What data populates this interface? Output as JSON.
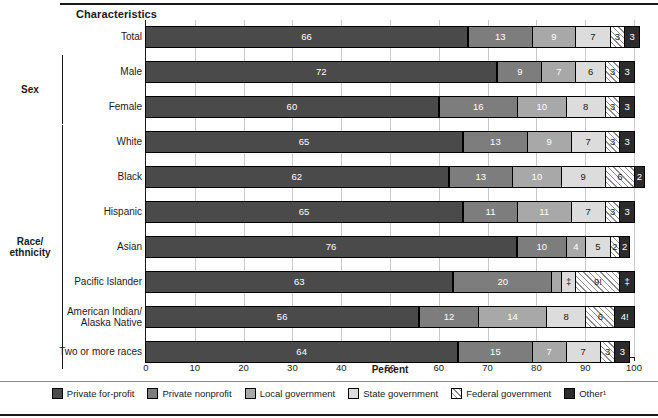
{
  "header": {
    "characteristics_label": "Characteristics"
  },
  "axis": {
    "xtitle": "Percent",
    "ticks": [
      "0",
      "10",
      "20",
      "30",
      "40",
      "50",
      "60",
      "70",
      "80",
      "90",
      "100"
    ]
  },
  "groups": [
    {
      "name": "",
      "label": ""
    },
    {
      "name": "sex",
      "label": "Sex"
    },
    {
      "name": "race-ethnicity",
      "label": "Race/\nethnicity"
    }
  ],
  "group_labels": {
    "sex": "Sex",
    "race_line1": "Race/",
    "race_line2": "ethnicity"
  },
  "legend": {
    "items": [
      {
        "key": "private-for-profit",
        "label": "Private for-profit",
        "color": "#4a4a4a"
      },
      {
        "key": "private-nonprofit",
        "label": "Private nonprofit",
        "color": "#7d7d7d"
      },
      {
        "key": "local-government",
        "label": "Local government",
        "color": "#a8a8a8"
      },
      {
        "key": "state-government",
        "label": "State government",
        "color": "#dcdcdc"
      },
      {
        "key": "federal-government",
        "label": "Federal government",
        "color": "#ffffff"
      },
      {
        "key": "other",
        "label": "Other¹",
        "color": "#2b2b2b"
      }
    ]
  },
  "chart_data": {
    "type": "bar",
    "orientation": "horizontal",
    "stacked": true,
    "title": "",
    "xlabel": "Percent",
    "ylabel": "Characteristics",
    "xlim": [
      0,
      100
    ],
    "grid": true,
    "legend_position": "bottom",
    "series": [
      {
        "name": "Private for-profit",
        "values": [
          66,
          72,
          60,
          65,
          62,
          65,
          76,
          63,
          56,
          64
        ]
      },
      {
        "name": "Private nonprofit",
        "values": [
          13,
          9,
          16,
          13,
          13,
          11,
          10,
          20,
          12,
          15
        ]
      },
      {
        "name": "Local government",
        "values": [
          9,
          7,
          10,
          9,
          10,
          11,
          4,
          2,
          14,
          7
        ]
      },
      {
        "name": "State government",
        "values": [
          7,
          6,
          8,
          7,
          9,
          7,
          5,
          3,
          8,
          7
        ]
      },
      {
        "name": "Federal government",
        "values": [
          3,
          3,
          3,
          3,
          6,
          3,
          2,
          9,
          6,
          3
        ]
      },
      {
        "name": "Other",
        "values": [
          3,
          3,
          3,
          3,
          2,
          3,
          2,
          3,
          4,
          3
        ]
      }
    ],
    "categories": [
      "Total",
      "Male",
      "Female",
      "White",
      "Black",
      "Hispanic",
      "Asian",
      "Pacific Islander",
      "American Indian/Alaska Native",
      "Two or more races"
    ],
    "rows": [
      {
        "label": "Total",
        "label_lines": [
          "Total"
        ],
        "group": "",
        "segments": [
          {
            "series": "Private for-profit",
            "value": 66,
            "text": "66"
          },
          {
            "series": "Private nonprofit",
            "value": 13,
            "text": "13"
          },
          {
            "series": "Local government",
            "value": 9,
            "text": "9"
          },
          {
            "series": "State government",
            "value": 7,
            "text": "7"
          },
          {
            "series": "Federal government",
            "value": 3,
            "text": "3"
          },
          {
            "series": "Other",
            "value": 3,
            "text": "3"
          }
        ]
      },
      {
        "label": "Male",
        "label_lines": [
          "Male"
        ],
        "group": "Sex",
        "segments": [
          {
            "series": "Private for-profit",
            "value": 72,
            "text": "72"
          },
          {
            "series": "Private nonprofit",
            "value": 9,
            "text": "9"
          },
          {
            "series": "Local government",
            "value": 7,
            "text": "7"
          },
          {
            "series": "State government",
            "value": 6,
            "text": "6"
          },
          {
            "series": "Federal government",
            "value": 3,
            "text": "3"
          },
          {
            "series": "Other",
            "value": 3,
            "text": "3"
          }
        ]
      },
      {
        "label": "Female",
        "label_lines": [
          "Female"
        ],
        "group": "Sex",
        "segments": [
          {
            "series": "Private for-profit",
            "value": 60,
            "text": "60"
          },
          {
            "series": "Private nonprofit",
            "value": 16,
            "text": "16"
          },
          {
            "series": "Local government",
            "value": 10,
            "text": "10"
          },
          {
            "series": "State government",
            "value": 8,
            "text": "8"
          },
          {
            "series": "Federal government",
            "value": 3,
            "text": "3"
          },
          {
            "series": "Other",
            "value": 3,
            "text": "3"
          }
        ]
      },
      {
        "label": "White",
        "label_lines": [
          "White"
        ],
        "group": "Race/ethnicity",
        "segments": [
          {
            "series": "Private for-profit",
            "value": 65,
            "text": "65"
          },
          {
            "series": "Private nonprofit",
            "value": 13,
            "text": "13"
          },
          {
            "series": "Local government",
            "value": 9,
            "text": "9"
          },
          {
            "series": "State government",
            "value": 7,
            "text": "7"
          },
          {
            "series": "Federal government",
            "value": 3,
            "text": "3"
          },
          {
            "series": "Other",
            "value": 3,
            "text": "3"
          }
        ]
      },
      {
        "label": "Black",
        "label_lines": [
          "Black"
        ],
        "group": "Race/ethnicity",
        "segments": [
          {
            "series": "Private for-profit",
            "value": 62,
            "text": "62"
          },
          {
            "series": "Private nonprofit",
            "value": 13,
            "text": "13"
          },
          {
            "series": "Local government",
            "value": 10,
            "text": "10"
          },
          {
            "series": "State government",
            "value": 9,
            "text": "9"
          },
          {
            "series": "Federal government",
            "value": 6,
            "text": "6"
          },
          {
            "series": "Other",
            "value": 2,
            "text": "2"
          }
        ]
      },
      {
        "label": "Hispanic",
        "label_lines": [
          "Hispanic"
        ],
        "group": "Race/ethnicity",
        "segments": [
          {
            "series": "Private for-profit",
            "value": 65,
            "text": "65"
          },
          {
            "series": "Private nonprofit",
            "value": 11,
            "text": "11"
          },
          {
            "series": "Local government",
            "value": 11,
            "text": "11"
          },
          {
            "series": "State government",
            "value": 7,
            "text": "7"
          },
          {
            "series": "Federal government",
            "value": 3,
            "text": "3"
          },
          {
            "series": "Other",
            "value": 3,
            "text": "3"
          }
        ]
      },
      {
        "label": "Asian",
        "label_lines": [
          "Asian"
        ],
        "group": "Race/ethnicity",
        "segments": [
          {
            "series": "Private for-profit",
            "value": 76,
            "text": "76"
          },
          {
            "series": "Private nonprofit",
            "value": 10,
            "text": "10"
          },
          {
            "series": "Local government",
            "value": 4,
            "text": "4"
          },
          {
            "series": "State government",
            "value": 5,
            "text": "5"
          },
          {
            "series": "Federal government",
            "value": 2,
            "text": "2"
          },
          {
            "series": "Other",
            "value": 2,
            "text": "2"
          }
        ]
      },
      {
        "label": "Pacific Islander",
        "label_lines": [
          "Pacific Islander"
        ],
        "group": "Race/ethnicity",
        "segments": [
          {
            "series": "Private for-profit",
            "value": 63,
            "text": "63"
          },
          {
            "series": "Private nonprofit",
            "value": 20,
            "text": "20"
          },
          {
            "series": "Local government",
            "value": 2,
            "text": ""
          },
          {
            "series": "State government",
            "value": 3,
            "text": "‡"
          },
          {
            "series": "Federal government",
            "value": 9,
            "text": "9!"
          },
          {
            "series": "Other",
            "value": 3,
            "text": "‡"
          }
        ]
      },
      {
        "label": "American Indian/ Alaska Native",
        "label_lines": [
          "American Indian/",
          "Alaska Native"
        ],
        "group": "Race/ethnicity",
        "segments": [
          {
            "series": "Private for-profit",
            "value": 56,
            "text": "56"
          },
          {
            "series": "Private nonprofit",
            "value": 12,
            "text": "12"
          },
          {
            "series": "Local government",
            "value": 14,
            "text": "14"
          },
          {
            "series": "State government",
            "value": 8,
            "text": "8"
          },
          {
            "series": "Federal government",
            "value": 6,
            "text": "6"
          },
          {
            "series": "Other",
            "value": 4,
            "text": "4!"
          }
        ]
      },
      {
        "label": "Two or more races",
        "label_lines": [
          "Two or more races"
        ],
        "group": "Race/ethnicity",
        "segments": [
          {
            "series": "Private for-profit",
            "value": 64,
            "text": "64"
          },
          {
            "series": "Private nonprofit",
            "value": 15,
            "text": "15"
          },
          {
            "series": "Local government",
            "value": 7,
            "text": "7"
          },
          {
            "series": "State government",
            "value": 7,
            "text": "7"
          },
          {
            "series": "Federal government",
            "value": 3,
            "text": "3"
          },
          {
            "series": "Other",
            "value": 3,
            "text": "3"
          }
        ]
      }
    ]
  }
}
